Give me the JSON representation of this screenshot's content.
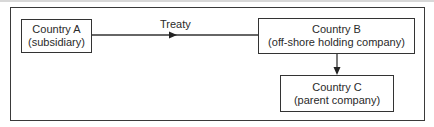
{
  "diagram": {
    "nodes": [
      {
        "id": "A",
        "title": "Country A",
        "subtitle": "(subsidiary)"
      },
      {
        "id": "B",
        "title": "Country B",
        "subtitle": "(off-shore holding company)"
      },
      {
        "id": "C",
        "title": "Country C",
        "subtitle": "(parent company)"
      }
    ],
    "edges": [
      {
        "from": "A",
        "to": "B",
        "label": "Treaty"
      },
      {
        "from": "B",
        "to": "C",
        "label": ""
      }
    ],
    "colors": {
      "line": "#333333",
      "background": "#ffffff"
    }
  }
}
